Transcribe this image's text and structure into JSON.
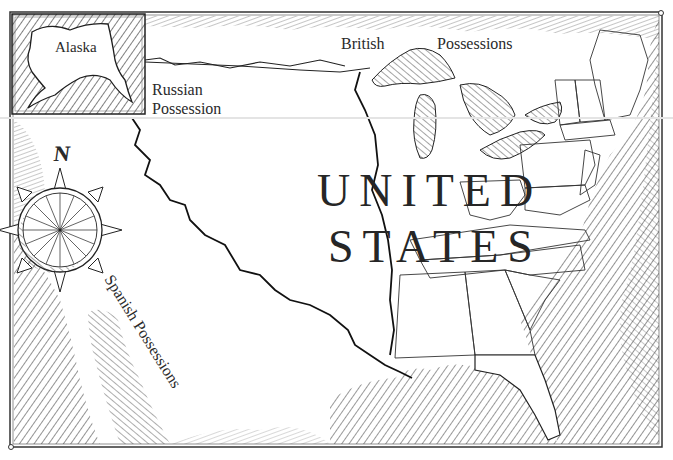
{
  "map": {
    "title_lines": [
      "UNITED",
      "STATES"
    ],
    "labels": {
      "inset": "Alaska",
      "north": "British",
      "north_2": "Possessions",
      "northwest_1": "Russian",
      "northwest_2": "Possession",
      "southwest": "Spanish Possessions"
    },
    "compass": {
      "icon": "compass-rose-icon",
      "north_label": "N"
    },
    "colors": {
      "ink": "#1e1e1e",
      "paper": "#ffffff",
      "hatch": "#3a3a3a",
      "scanline": "#e4e4e4"
    }
  }
}
